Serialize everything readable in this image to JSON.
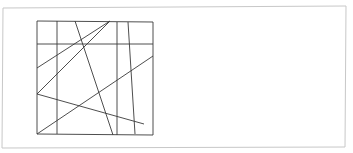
{
  "document": {
    "title": "Line drawing figure",
    "background_color": "#ffffff",
    "width": 353,
    "height": 153
  },
  "page_border": {
    "name": "page-border",
    "color": "#c8c8c8",
    "stroke_width": 1,
    "points": "3,8 346,6 345,147 2,148"
  },
  "figure": {
    "name": "square-figure",
    "stroke_color": "#3a3a3a",
    "stroke_width": 0.9,
    "square": {
      "label": "outer-square",
      "x": 37,
      "y": 21,
      "width": 116,
      "height": 114,
      "points": "37,21 153,22 153,135 37,134"
    },
    "grid_lines": [
      {
        "label": "vertical-grid-1",
        "x1": 57,
        "y1": 21,
        "x2": 57,
        "y2": 134
      },
      {
        "label": "vertical-grid-2",
        "x1": 117,
        "y1": 22,
        "x2": 117,
        "y2": 135
      },
      {
        "label": "horizontal-grid-1",
        "x1": 37,
        "y1": 44,
        "x2": 153,
        "y2": 44
      }
    ],
    "diagonals": [
      {
        "label": "diagonal-1",
        "x1": 110,
        "y1": 21,
        "x2": 37,
        "y2": 94
      },
      {
        "label": "diagonal-2",
        "x1": 110,
        "y1": 21,
        "x2": 37,
        "y2": 68
      },
      {
        "label": "diagonal-3",
        "x1": 75,
        "y1": 21,
        "x2": 113,
        "y2": 135
      },
      {
        "label": "diagonal-4",
        "x1": 128,
        "y1": 22,
        "x2": 135,
        "y2": 134
      },
      {
        "label": "diagonal-5",
        "x1": 153,
        "y1": 56,
        "x2": 37,
        "y2": 134
      },
      {
        "label": "diagonal-6",
        "x1": 37,
        "y1": 94,
        "x2": 144,
        "y2": 124
      }
    ]
  }
}
